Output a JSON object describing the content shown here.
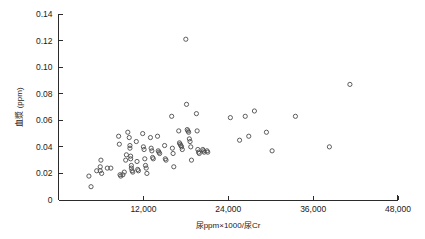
{
  "chart_data": {
    "type": "scatter",
    "title": "",
    "xlabel": "尿ppm×1000/尿Cr",
    "ylabel": "血漿 (ppm)",
    "xlim": [
      0,
      48000
    ],
    "ylim": [
      0,
      0.14
    ],
    "grid": false,
    "legend": null,
    "marker": "open-circle",
    "xticks": [
      0,
      12000,
      24000,
      36000,
      48000
    ],
    "xtick_labels": [
      "",
      "12,000",
      "24,000",
      "36,000",
      "48,000"
    ],
    "yticks": [
      0,
      0.02,
      0.04,
      0.06,
      0.08,
      0.1,
      0.12,
      0.14
    ],
    "ytick_labels": [
      "0",
      "0.02",
      "0.04",
      "0.06",
      "0.08",
      "0.10",
      "0.12",
      "0.14"
    ],
    "series": [
      {
        "name": "subjects",
        "points": [
          [
            4300,
            0.018
          ],
          [
            4600,
            0.01
          ],
          [
            5400,
            0.022
          ],
          [
            5900,
            0.025
          ],
          [
            5900,
            0.022
          ],
          [
            6000,
            0.03
          ],
          [
            6100,
            0.02
          ],
          [
            6900,
            0.024
          ],
          [
            7400,
            0.024
          ],
          [
            8500,
            0.048
          ],
          [
            8600,
            0.042
          ],
          [
            8700,
            0.019
          ],
          [
            8800,
            0.018
          ],
          [
            9100,
            0.019
          ],
          [
            9300,
            0.021
          ],
          [
            9500,
            0.03
          ],
          [
            9600,
            0.034
          ],
          [
            9800,
            0.051
          ],
          [
            10000,
            0.047
          ],
          [
            10100,
            0.041
          ],
          [
            10100,
            0.039
          ],
          [
            10200,
            0.033
          ],
          [
            10200,
            0.031
          ],
          [
            10300,
            0.026
          ],
          [
            10300,
            0.024
          ],
          [
            10400,
            0.022
          ],
          [
            10500,
            0.021
          ],
          [
            11000,
            0.044
          ],
          [
            11100,
            0.029
          ],
          [
            11200,
            0.023
          ],
          [
            11300,
            0.022
          ],
          [
            11900,
            0.05
          ],
          [
            12000,
            0.04
          ],
          [
            12100,
            0.038
          ],
          [
            12200,
            0.031
          ],
          [
            12300,
            0.026
          ],
          [
            12400,
            0.024
          ],
          [
            12500,
            0.02
          ],
          [
            13000,
            0.047
          ],
          [
            13100,
            0.039
          ],
          [
            13200,
            0.037
          ],
          [
            13300,
            0.032
          ],
          [
            13400,
            0.031
          ],
          [
            14000,
            0.048
          ],
          [
            14100,
            0.037
          ],
          [
            14200,
            0.036
          ],
          [
            14300,
            0.035
          ],
          [
            15000,
            0.041
          ],
          [
            15100,
            0.031
          ],
          [
            15200,
            0.03
          ],
          [
            16000,
            0.063
          ],
          [
            16100,
            0.039
          ],
          [
            16200,
            0.035
          ],
          [
            16300,
            0.025
          ],
          [
            17000,
            0.052
          ],
          [
            17100,
            0.043
          ],
          [
            17200,
            0.042
          ],
          [
            17300,
            0.041
          ],
          [
            17400,
            0.04
          ],
          [
            17500,
            0.038
          ],
          [
            18000,
            0.121
          ],
          [
            18100,
            0.072
          ],
          [
            18200,
            0.053
          ],
          [
            18300,
            0.052
          ],
          [
            18400,
            0.051
          ],
          [
            18500,
            0.046
          ],
          [
            18600,
            0.044
          ],
          [
            18700,
            0.04
          ],
          [
            18800,
            0.03
          ],
          [
            19500,
            0.065
          ],
          [
            19600,
            0.052
          ],
          [
            19700,
            0.038
          ],
          [
            19800,
            0.036
          ],
          [
            19900,
            0.035
          ],
          [
            20400,
            0.038
          ],
          [
            20500,
            0.037
          ],
          [
            20600,
            0.036
          ],
          [
            21000,
            0.037
          ],
          [
            21100,
            0.036
          ],
          [
            24300,
            0.062
          ],
          [
            25600,
            0.045
          ],
          [
            26400,
            0.063
          ],
          [
            26900,
            0.048
          ],
          [
            27700,
            0.067
          ],
          [
            29400,
            0.051
          ],
          [
            30200,
            0.037
          ],
          [
            33500,
            0.063
          ],
          [
            38300,
            0.04
          ],
          [
            41200,
            0.087
          ]
        ]
      }
    ]
  },
  "axes": {
    "x_axis_name": "x-axis",
    "y_axis_name": "y-axis"
  }
}
